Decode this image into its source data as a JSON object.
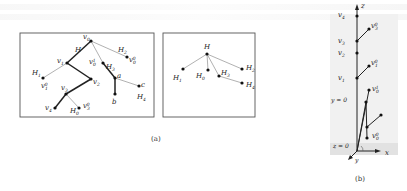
{
  "figure": {
    "panel_a_caption": "(a)",
    "panel_b_caption": "(b)",
    "panel_a_left": {
      "nodes": [
        {
          "id": "v0",
          "label": "v",
          "sub": "0",
          "x": 91,
          "y": 41
        },
        {
          "id": "v1",
          "label": "v",
          "sub": "1",
          "x": 67,
          "y": 63
        },
        {
          "id": "v2",
          "label": "v",
          "sub": "2",
          "x": 91,
          "y": 79
        },
        {
          "id": "v3",
          "label": "v",
          "sub": "3",
          "x": 66,
          "y": 94
        },
        {
          "id": "v4",
          "label": "v",
          "sub": "4",
          "x": 55,
          "y": 108
        },
        {
          "id": "H1",
          "label": "H",
          "sub": "1",
          "x": 43,
          "y": 78
        },
        {
          "id": "H0",
          "label": "H",
          "sub": "0",
          "x": 79,
          "y": 108
        },
        {
          "id": "H2",
          "label": "H",
          "sub": "2",
          "x": 127,
          "y": 57
        },
        {
          "id": "v0_1",
          "label": "v",
          "sub": "0",
          "sup": "1",
          "x": 103,
          "y": 63
        },
        {
          "id": "a",
          "label": "a",
          "x": 115,
          "y": 78
        },
        {
          "id": "b",
          "label": "b",
          "x": 115,
          "y": 94
        },
        {
          "id": "c",
          "label": "c",
          "x": 139,
          "y": 86
        }
      ],
      "labels": {
        "H": "H",
        "H1": "H",
        "H2": "H",
        "H3": "H",
        "H4": "H",
        "H0": "H",
        "v0": "v",
        "v1": "v",
        "v2": "v",
        "v3": "v",
        "v4": "v",
        "v10": "v",
        "v00": "v",
        "v01": "v",
        "v30": "v",
        "a": "a",
        "b": "b",
        "c": "c"
      }
    },
    "panel_a_right": {
      "root_label": "H",
      "children": [
        "H1",
        "H0",
        "H3",
        "H2",
        "H4"
      ]
    },
    "panel_b": {
      "axis_z": "z",
      "axis_x": "x",
      "axis_y": "y",
      "plane_y0": "y = 0",
      "plane_z0": "z = 0",
      "spine_nodes": [
        "v4",
        "v3",
        "v2",
        "v1"
      ]
    }
  }
}
